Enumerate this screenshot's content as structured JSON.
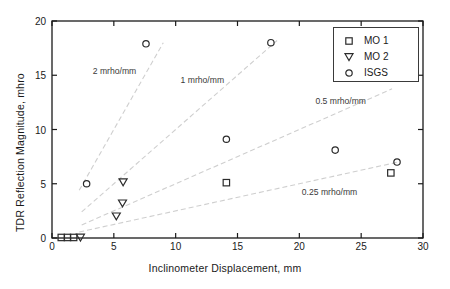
{
  "chart_data": {
    "type": "scatter",
    "title": "",
    "xlabel": "Inclinometer Displacement,  mm",
    "ylabel": "TDR Reflection Magnitude,  mhro",
    "xlim": [
      0,
      30
    ],
    "ylim": [
      0,
      20
    ],
    "xticks": [
      0,
      5,
      10,
      15,
      20,
      25,
      30
    ],
    "yticks": [
      0,
      5,
      10,
      15,
      20
    ],
    "grid": false,
    "legend_position": "top-right",
    "series": [
      {
        "name": "MO 1",
        "marker": "square-open",
        "points": [
          {
            "x": 0.75,
            "y": 0.05
          },
          {
            "x": 1.25,
            "y": 0.05
          },
          {
            "x": 1.75,
            "y": 0.05
          },
          {
            "x": 14.1,
            "y": 5.1
          },
          {
            "x": 27.4,
            "y": 6.0
          }
        ]
      },
      {
        "name": "MO 2",
        "marker": "triangle-down-open",
        "points": [
          {
            "x": 2.3,
            "y": 0.05
          },
          {
            "x": 5.2,
            "y": 2.0
          },
          {
            "x": 5.7,
            "y": 3.2
          },
          {
            "x": 5.75,
            "y": 5.15
          }
        ]
      },
      {
        "name": "ISGS",
        "marker": "circle-open",
        "points": [
          {
            "x": 2.8,
            "y": 5.0
          },
          {
            "x": 7.6,
            "y": 17.9
          },
          {
            "x": 14.1,
            "y": 9.1
          },
          {
            "x": 17.7,
            "y": 18.0
          },
          {
            "x": 22.9,
            "y": 8.1
          },
          {
            "x": 27.9,
            "y": 7.0
          }
        ]
      }
    ],
    "reference_lines": [
      {
        "label": "2  mrho/mm",
        "slope": 2,
        "x_start": 2.2,
        "x_end": 9.0,
        "label_x": 3.3,
        "label_y": 15.4
      },
      {
        "label": "1 mrho/mm",
        "slope": 1,
        "x_start": 2.4,
        "x_end": 18.2,
        "label_x": 10.4,
        "label_y": 14.6
      },
      {
        "label": "0.5 mrho/mm",
        "slope": 0.5,
        "x_start": 2.4,
        "x_end": 27.5,
        "label_x": 21.3,
        "label_y": 12.6
      },
      {
        "label": "0.25 mrho/mm",
        "slope": 0.25,
        "x_start": 2.2,
        "x_end": 28.0,
        "label_x": 20.2,
        "label_y": 4.2
      }
    ]
  },
  "legend": {
    "entries": [
      {
        "label": "MO 1",
        "marker": "square-open"
      },
      {
        "label": "MO 2",
        "marker": "triangle-down-open"
      },
      {
        "label": "ISGS",
        "marker": "circle-open"
      }
    ]
  },
  "colors": {
    "axis": "#1a1a1a",
    "marker": "#2b2b2b",
    "reference_line": "#cfcfcf",
    "background": "#ffffff"
  }
}
